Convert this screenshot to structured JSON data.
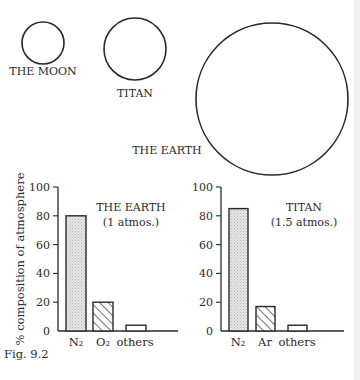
{
  "figure": {
    "caption": "Fig. 9.2",
    "bodies": [
      {
        "name": "THE MOON",
        "cx": 43,
        "cy": 43,
        "r": 21,
        "label_x": 43,
        "label_y": 75
      },
      {
        "name": "TITAN",
        "cx": 135,
        "cy": 49,
        "r": 31,
        "label_x": 135,
        "label_y": 97
      },
      {
        "name": "THE EARTH",
        "cx": 272,
        "cy": 99,
        "r": 76,
        "label_x": 167,
        "label_y": 154
      }
    ],
    "y_axis_label": "% composition of atmosphere"
  },
  "chart_data": [
    {
      "type": "bar",
      "title": "THE EARTH",
      "subtitle": "(1 atmos.)",
      "categories": [
        "N₂",
        "O₂",
        "others"
      ],
      "values": [
        80,
        20,
        4
      ],
      "patterns": [
        "stipple",
        "hatch",
        "plain"
      ],
      "ylabel": "% composition of atmosphere",
      "yticks": [
        0,
        20,
        40,
        60,
        80,
        100
      ],
      "ylim": [
        0,
        100
      ]
    },
    {
      "type": "bar",
      "title": "TITAN",
      "subtitle": "(1.5 atmos.)",
      "categories": [
        "N₂",
        "Ar",
        "others"
      ],
      "values": [
        85,
        17,
        4
      ],
      "patterns": [
        "stipple",
        "hatch",
        "plain"
      ],
      "ylabel": "% composition of atmosphere",
      "yticks": [
        0,
        20,
        40,
        60,
        80,
        100
      ],
      "ylim": [
        0,
        100
      ]
    }
  ]
}
